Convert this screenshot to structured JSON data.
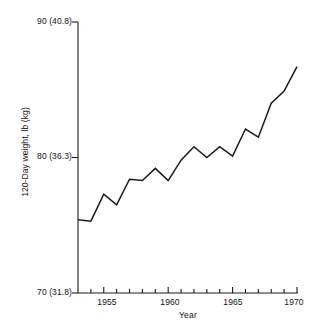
{
  "chart_data": {
    "type": "line",
    "title": "",
    "xlabel": "Year",
    "ylabel": "120-Day weight, lb (kg)",
    "x": [
      1953,
      1954,
      1955,
      1956,
      1957,
      1958,
      1959,
      1960,
      1961,
      1962,
      1963,
      1964,
      1965,
      1966,
      1967,
      1968,
      1969,
      1970
    ],
    "values": [
      75.4,
      75.3,
      77.3,
      76.5,
      78.4,
      78.3,
      79.2,
      78.3,
      79.8,
      80.8,
      80.0,
      80.8,
      80.1,
      82.1,
      81.5,
      84.0,
      84.9,
      86.7
    ],
    "series": [
      {
        "name": "120-Day weight",
        "values": [
          75.4,
          75.3,
          77.3,
          76.5,
          78.4,
          78.3,
          79.2,
          78.3,
          79.8,
          80.8,
          80.0,
          80.8,
          80.1,
          82.1,
          81.5,
          84.0,
          84.9,
          86.7
        ]
      }
    ],
    "ylim": [
      70,
      90
    ],
    "xlim": [
      1953,
      1970
    ],
    "grid": false,
    "legend": null,
    "y_axis": {
      "ticks": [
        {
          "value": 90,
          "label": "90 (40.8)"
        },
        {
          "value": 80,
          "label": "80 (36.3)"
        },
        {
          "value": 70,
          "label": "70 (31.8)"
        }
      ],
      "unit_primary": "lb",
      "unit_secondary": "kg"
    },
    "x_axis": {
      "major_ticks": [
        {
          "value": 1955,
          "label": "1955"
        },
        {
          "value": 1960,
          "label": "1960"
        },
        {
          "value": 1965,
          "label": "1965"
        },
        {
          "value": 1970,
          "label": "1970"
        }
      ],
      "minor_tick_values": [
        1954,
        1955,
        1956,
        1957,
        1958,
        1959,
        1960,
        1961,
        1962,
        1963,
        1964,
        1965,
        1966,
        1967,
        1968,
        1969,
        1970
      ]
    },
    "line_color": "#1a1a1a",
    "axis_color": "#1a1a1a"
  }
}
